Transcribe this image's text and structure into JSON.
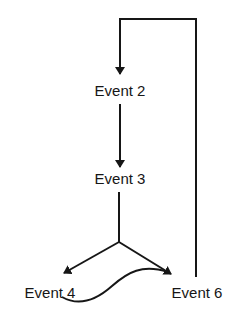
{
  "diagram": {
    "type": "flow",
    "nodes": [
      {
        "id": "event2",
        "label": "Event 2"
      },
      {
        "id": "event3",
        "label": "Event 3"
      },
      {
        "id": "event4",
        "label": "Event 4"
      },
      {
        "id": "event6",
        "label": "Event 6"
      }
    ],
    "edges": [
      {
        "from": "event2",
        "to": "event3",
        "style": "arrow"
      },
      {
        "from": "event3",
        "to": "event4",
        "style": "arrow (fork)"
      },
      {
        "from": "event3",
        "to": "event6",
        "style": "arrow (fork)"
      },
      {
        "from": "event4",
        "to": "event6",
        "style": "curved arrow"
      },
      {
        "from": "event6",
        "to": "event2",
        "style": "loop-back arrow"
      }
    ],
    "colors": {
      "background": "#ffffff",
      "ink": "#161616"
    }
  }
}
